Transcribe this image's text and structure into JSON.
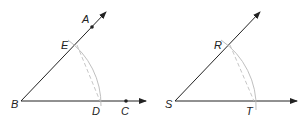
{
  "figures": [
    {
      "id": "left",
      "vertex": {
        "label": "B",
        "x": 21,
        "y": 101
      },
      "upper_ray_end": {
        "x": 106,
        "y": 12
      },
      "lower_ray_end": {
        "x": 146,
        "y": 101
      },
      "points": {
        "A": {
          "label": "A",
          "x": 92,
          "y": 27
        },
        "C": {
          "label": "C",
          "x": 126,
          "y": 101
        },
        "D": {
          "label": "D",
          "x": 100,
          "y": 101
        },
        "E": {
          "label": "E",
          "x": 77,
          "y": 44
        }
      }
    },
    {
      "id": "right",
      "vertex": {
        "label": "S",
        "x": 175,
        "y": 101
      },
      "upper_ray_end": {
        "x": 260,
        "y": 12
      },
      "lower_ray_end": {
        "x": 297,
        "y": 101
      },
      "points": {
        "R": {
          "label": "R",
          "x": 230,
          "y": 44
        },
        "T": {
          "label": "T",
          "x": 255,
          "y": 101
        }
      }
    }
  ],
  "colors": {
    "line": "#222222",
    "arc": "#b8b8b8",
    "dashed": "#c0c0c0"
  }
}
